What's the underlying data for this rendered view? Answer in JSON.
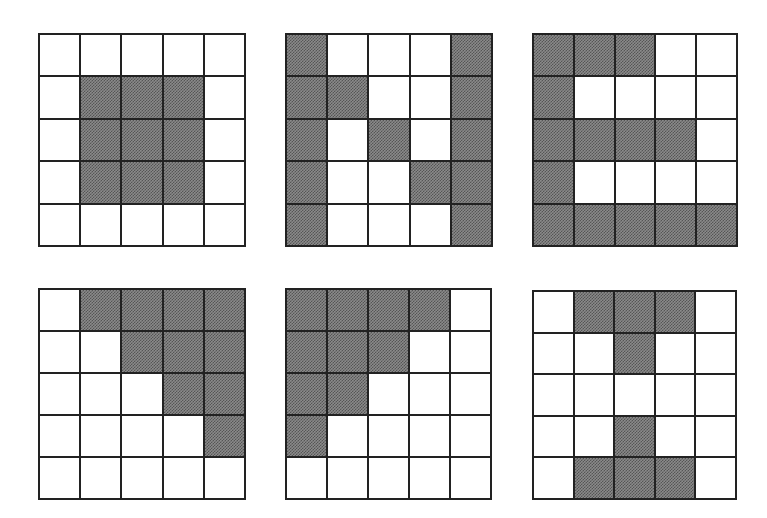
{
  "figure": {
    "fill_color": "#8a8a8a",
    "line_color": "#222222",
    "grids": [
      {
        "name": "grid-1",
        "position": {
          "left": 38,
          "top": 33,
          "width": 208,
          "height": 214
        },
        "cells": [
          [
            0,
            0,
            0,
            0,
            0
          ],
          [
            0,
            1,
            1,
            1,
            0
          ],
          [
            0,
            1,
            1,
            1,
            0
          ],
          [
            0,
            1,
            1,
            1,
            0
          ],
          [
            0,
            0,
            0,
            0,
            0
          ]
        ]
      },
      {
        "name": "grid-2",
        "position": {
          "left": 285,
          "top": 33,
          "width": 208,
          "height": 214
        },
        "cells": [
          [
            1,
            0,
            0,
            0,
            1
          ],
          [
            1,
            1,
            0,
            0,
            1
          ],
          [
            1,
            0,
            1,
            0,
            1
          ],
          [
            1,
            0,
            0,
            1,
            1
          ],
          [
            1,
            0,
            0,
            0,
            1
          ]
        ]
      },
      {
        "name": "grid-3",
        "position": {
          "left": 532,
          "top": 33,
          "width": 206,
          "height": 214
        },
        "cells": [
          [
            1,
            1,
            1,
            0,
            0
          ],
          [
            1,
            0,
            0,
            0,
            0
          ],
          [
            1,
            1,
            1,
            1,
            0
          ],
          [
            1,
            0,
            0,
            0,
            0
          ],
          [
            1,
            1,
            1,
            1,
            1
          ]
        ]
      },
      {
        "name": "grid-4",
        "position": {
          "left": 38,
          "top": 288,
          "width": 208,
          "height": 212
        },
        "cells": [
          [
            0,
            1,
            1,
            1,
            1
          ],
          [
            0,
            0,
            1,
            1,
            1
          ],
          [
            0,
            0,
            0,
            1,
            1
          ],
          [
            0,
            0,
            0,
            0,
            1
          ],
          [
            0,
            0,
            0,
            0,
            0
          ]
        ]
      },
      {
        "name": "grid-5",
        "position": {
          "left": 285,
          "top": 288,
          "width": 207,
          "height": 212
        },
        "cells": [
          [
            1,
            1,
            1,
            1,
            0
          ],
          [
            1,
            1,
            1,
            0,
            0
          ],
          [
            1,
            1,
            0,
            0,
            0
          ],
          [
            1,
            0,
            0,
            0,
            0
          ],
          [
            0,
            0,
            0,
            0,
            0
          ]
        ]
      },
      {
        "name": "grid-6",
        "position": {
          "left": 532,
          "top": 290,
          "width": 205,
          "height": 210
        },
        "cells": [
          [
            0,
            1,
            1,
            1,
            0
          ],
          [
            0,
            0,
            1,
            0,
            0
          ],
          [
            0,
            0,
            0,
            0,
            0
          ],
          [
            0,
            0,
            1,
            0,
            0
          ],
          [
            0,
            1,
            1,
            1,
            0
          ]
        ]
      }
    ]
  }
}
